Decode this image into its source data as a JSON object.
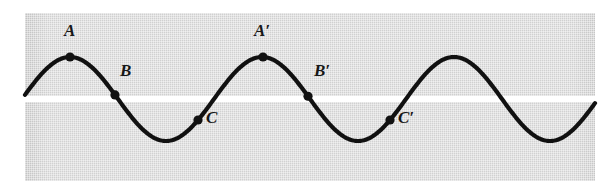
{
  "figure": {
    "kind": "wave-diagram",
    "panel_color": "#d9d9d9",
    "band_color": "#ffffff",
    "curve_color": "#111111",
    "dot_color": "#111111",
    "label_color": "#171717"
  },
  "chart_data": {
    "type": "line",
    "title": "",
    "xlabel": "",
    "ylabel": "",
    "grid": false,
    "legend": null,
    "xlim": [
      0,
      3.0
    ],
    "ylim": [
      -1.15,
      1.15
    ],
    "waveform": {
      "shape": "sinusoid",
      "amplitude": 1.0,
      "wavelength_px": 192,
      "cycles_shown": 3,
      "baseline_y_px": 99,
      "peak_y_px": 50,
      "trough_y_px": 134
    },
    "series": [
      {
        "name": "wave",
        "x": [
          0.0,
          0.125,
          0.25,
          0.375,
          0.5,
          0.625,
          0.75,
          0.875,
          1.0,
          1.125,
          1.25,
          1.375,
          1.5,
          1.625,
          1.75,
          1.875,
          2.0,
          2.125,
          2.25,
          2.375,
          2.5,
          2.625,
          2.75,
          2.875,
          3.0
        ],
        "values": [
          0.0,
          0.707,
          1.0,
          0.707,
          0.0,
          -0.707,
          -1.0,
          -0.707,
          0.0,
          0.707,
          1.0,
          0.707,
          0.0,
          -0.707,
          -1.0,
          -0.707,
          0.0,
          0.707,
          1.0,
          0.707,
          0.0,
          -0.707,
          -1.0,
          -0.707,
          0.0
        ]
      }
    ],
    "annotations": [
      {
        "id": "A",
        "label": "A",
        "x": 0.25,
        "y": 1.0,
        "phase_deg": 90,
        "dot_px": [
          70,
          50
        ],
        "label_px": [
          64,
          22
        ]
      },
      {
        "id": "B",
        "label": "B",
        "x": 0.44,
        "y": 0.2,
        "phase_deg": 158,
        "dot_px": [
          115,
          90
        ],
        "label_px": [
          120,
          62
        ]
      },
      {
        "id": "C",
        "label": "C",
        "x": 0.665,
        "y": -0.5,
        "phase_deg": 239,
        "dot_px": [
          198,
          108
        ],
        "label_px": [
          206,
          109
        ]
      },
      {
        "id": "A'",
        "label": "A′",
        "x": 1.25,
        "y": 1.0,
        "phase_deg": 450,
        "dot_px": [
          263,
          50
        ],
        "label_px": [
          254,
          22
        ]
      },
      {
        "id": "B'",
        "label": "B′",
        "x": 1.44,
        "y": 0.2,
        "phase_deg": 518,
        "dot_px": [
          308,
          89
        ],
        "label_px": [
          314,
          62
        ]
      },
      {
        "id": "C'",
        "label": "C′",
        "x": 1.665,
        "y": -0.5,
        "phase_deg": 599,
        "dot_px": [
          390,
          108
        ],
        "label_px": [
          398,
          109
        ]
      }
    ]
  }
}
